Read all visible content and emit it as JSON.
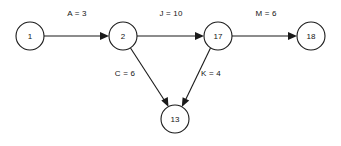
{
  "diagram": {
    "type": "directed-graph",
    "background_color": "#ffffff",
    "stroke_color": "#1a1a1a",
    "text_color": "#141414",
    "node_radius": 14,
    "nodes": [
      {
        "id": "n1",
        "label": "1",
        "cx": 30,
        "cy": 36
      },
      {
        "id": "n2",
        "label": "2",
        "cx": 123,
        "cy": 36
      },
      {
        "id": "n17",
        "label": "17",
        "cx": 218,
        "cy": 36
      },
      {
        "id": "n18",
        "label": "18",
        "cx": 311,
        "cy": 36
      },
      {
        "id": "n13",
        "label": "13",
        "cx": 175,
        "cy": 119
      }
    ],
    "edges": [
      {
        "id": "e-a",
        "from": "n1",
        "to": "n2",
        "activity": "A",
        "duration": 3,
        "label": "A = 3",
        "label_x": 77,
        "label_y": 13,
        "arrow": "end"
      },
      {
        "id": "e-j",
        "from": "n2",
        "to": "n17",
        "activity": "J",
        "duration": 10,
        "label": "J = 10",
        "label_x": 171,
        "label_y": 13,
        "arrow": "end"
      },
      {
        "id": "e-m",
        "from": "n17",
        "to": "n18",
        "activity": "M",
        "duration": 6,
        "label": "M = 6",
        "label_x": 266,
        "label_y": 13,
        "arrow": "end"
      },
      {
        "id": "e-c",
        "from": "n2",
        "to": "n13",
        "activity": "C",
        "duration": 6,
        "label": "C = 6",
        "label_x": 125,
        "label_y": 73,
        "arrow": "end"
      },
      {
        "id": "e-k",
        "from": "n17",
        "to": "n13",
        "activity": "K",
        "duration": 4,
        "label": "K = 4",
        "label_x": 211,
        "label_y": 73,
        "arrow": "end"
      }
    ]
  }
}
